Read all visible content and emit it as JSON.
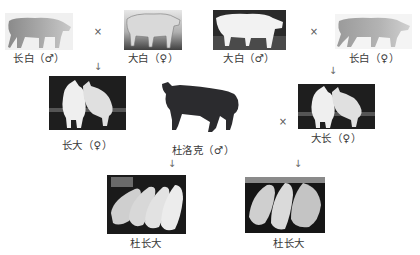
{
  "diagram": {
    "title": "",
    "parents_left": {
      "male": {
        "breed": "长白",
        "sex_symbol": "♂",
        "label": "长白（♂）"
      },
      "female": {
        "breed": "大白",
        "sex_symbol": "♀",
        "label": "大白（♀）"
      },
      "cross_symbol": "×"
    },
    "parents_right": {
      "male": {
        "breed": "大白",
        "sex_symbol": "♂",
        "label": "大白（♂）"
      },
      "female": {
        "breed": "长白",
        "sex_symbol": "♀",
        "label": "长白（♀）"
      },
      "cross_symbol": "×"
    },
    "f1_left": {
      "breed": "长大",
      "sex_symbol": "♀",
      "label": "长大（♀）"
    },
    "f1_right": {
      "breed": "大长",
      "sex_symbol": "♀",
      "label": "大长（♀）"
    },
    "terminal_sire": {
      "breed": "杜洛克",
      "sex_symbol": "♂",
      "label": "杜洛克（♂）"
    },
    "middle_cross_symbol": "×",
    "offspring_left": {
      "label": "杜长大"
    },
    "offspring_right": {
      "label": "杜长大"
    },
    "arrow_glyph": "↓"
  }
}
